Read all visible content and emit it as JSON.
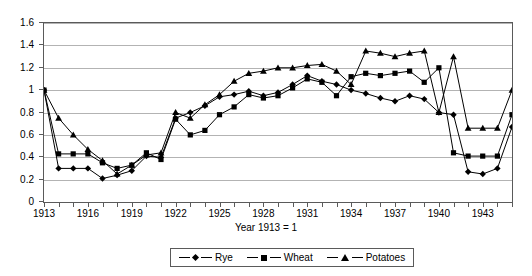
{
  "chart_data": {
    "type": "line",
    "title": "",
    "xlabel": "Year 1913 = 1",
    "ylabel": "",
    "xlim": [
      1913,
      1945
    ],
    "ylim": [
      0,
      1.6
    ],
    "grid": true,
    "legend_position": "bottom",
    "x": [
      1913,
      1914,
      1915,
      1916,
      1917,
      1918,
      1919,
      1920,
      1921,
      1922,
      1923,
      1924,
      1925,
      1926,
      1927,
      1928,
      1929,
      1930,
      1931,
      1932,
      1933,
      1934,
      1935,
      1936,
      1937,
      1938,
      1939,
      1940,
      1941,
      1942,
      1943,
      1944,
      1945
    ],
    "xtick_labels": [
      "1913",
      "1916",
      "1919",
      "1922",
      "1925",
      "1928",
      "1931",
      "1934",
      "1937",
      "1940",
      "1943"
    ],
    "xtick_values": [
      1913,
      1916,
      1919,
      1922,
      1925,
      1928,
      1931,
      1934,
      1937,
      1940,
      1943
    ],
    "ytick_labels": [
      "0",
      "0.2",
      "0.4",
      "0.6",
      "0.8",
      "1",
      "1.2",
      "1.4",
      "1.6"
    ],
    "ytick_values": [
      0,
      0.2,
      0.4,
      0.6,
      0.8,
      1.0,
      1.2,
      1.4,
      1.6
    ],
    "series": [
      {
        "name": "Rye",
        "marker": "diamond",
        "values": [
          1.0,
          0.3,
          0.3,
          0.3,
          0.21,
          0.24,
          0.28,
          0.41,
          0.4,
          0.75,
          0.8,
          0.86,
          0.94,
          0.96,
          0.99,
          0.95,
          0.98,
          1.05,
          1.13,
          1.08,
          1.05,
          1.0,
          0.97,
          0.93,
          0.9,
          0.95,
          0.92,
          0.8,
          0.78,
          0.27,
          0.25,
          0.3,
          0.67
        ]
      },
      {
        "name": "Wheat",
        "marker": "square",
        "values": [
          1.0,
          0.43,
          0.43,
          0.43,
          0.35,
          0.3,
          0.33,
          0.44,
          0.38,
          0.74,
          0.6,
          0.64,
          0.78,
          0.85,
          0.96,
          0.93,
          0.95,
          1.02,
          1.1,
          1.07,
          0.95,
          1.12,
          1.15,
          1.13,
          1.15,
          1.17,
          1.07,
          1.2,
          0.44,
          0.41,
          0.41,
          0.41,
          0.78
        ]
      },
      {
        "name": "Potatoes",
        "marker": "triangle",
        "values": [
          1.0,
          0.75,
          0.6,
          0.47,
          0.37,
          0.25,
          0.33,
          0.42,
          0.44,
          0.8,
          0.75,
          0.87,
          0.96,
          1.08,
          1.15,
          1.17,
          1.2,
          1.2,
          1.22,
          1.23,
          1.17,
          1.05,
          1.35,
          1.33,
          1.3,
          1.33,
          1.35,
          0.8,
          1.3,
          0.66,
          0.66,
          0.66,
          1.0
        ]
      }
    ]
  },
  "legend": {
    "entries": [
      {
        "label": "Rye"
      },
      {
        "label": "Wheat"
      },
      {
        "label": "Potatoes"
      }
    ]
  },
  "axis": {
    "x_title": "Year 1913 = 1"
  },
  "colors": {
    "series": "#000000",
    "grid": "#b3b3b3",
    "frame": "#5a5a5a"
  }
}
